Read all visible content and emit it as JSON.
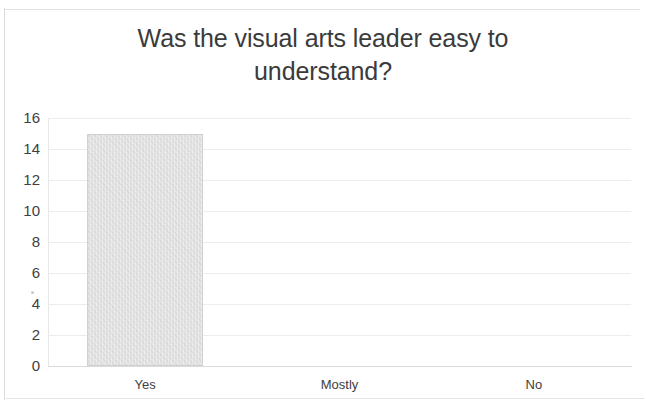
{
  "chart_data": {
    "type": "bar",
    "title": "Was the visual arts leader easy to understand?",
    "title_line1": "Was the visual arts leader easy to",
    "title_line2": "understand?",
    "categories": [
      "Yes",
      "Mostly",
      "No"
    ],
    "values": [
      15,
      0,
      0
    ],
    "series": [
      {
        "name": "Responses",
        "values": [
          15,
          0,
          0
        ]
      }
    ],
    "xlabel": "",
    "ylabel": "",
    "ylim": [
      0,
      16
    ],
    "ytick_labels": [
      "16",
      "14",
      "12",
      "10",
      "8",
      "6",
      "4",
      "2",
      "0"
    ],
    "ytick_values": [
      16,
      14,
      12,
      10,
      8,
      6,
      4,
      2,
      0
    ],
    "grid": true,
    "legend": false,
    "bar_color": "#d6d6d6",
    "title_color": "#3b3b3b",
    "tick_color": "#404040",
    "gridline_color": "#ededed",
    "background_color": "#ffffff"
  }
}
